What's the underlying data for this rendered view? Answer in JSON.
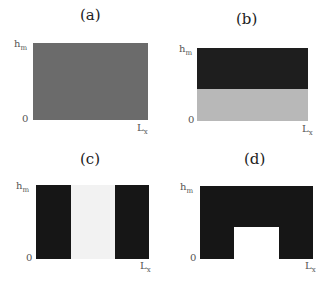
{
  "figure": {
    "panels": [
      {
        "label": "(a)",
        "y_top": "h",
        "y_top_sub": "m",
        "y_bottom": "0",
        "x_right": "L",
        "x_right_sub": "x",
        "description": "uniform medium grey",
        "colors": {
          "fill": "#6b6b6b"
        }
      },
      {
        "label": "(b)",
        "y_top": "h",
        "y_top_sub": "m",
        "y_bottom": "0",
        "x_right": "L",
        "x_right_sub": "x",
        "description": "dark upper half, light lower half",
        "colors": {
          "top": "#1e1e1e",
          "bottom": "#b8b8b8"
        }
      },
      {
        "label": "(c)",
        "y_top": "h",
        "y_top_sub": "m",
        "y_bottom": "0",
        "x_right": "L",
        "x_right_sub": "x",
        "description": "dark side columns, light center column",
        "colors": {
          "dark": "#161616",
          "light": "#f2f2f2"
        }
      },
      {
        "label": "(d)",
        "y_top": "h",
        "y_top_sub": "m",
        "y_bottom": "0",
        "x_right": "L",
        "x_right_sub": "x",
        "description": "dark with white notch at bottom center",
        "colors": {
          "dark": "#161616",
          "notch": "#ffffff"
        }
      }
    ]
  }
}
